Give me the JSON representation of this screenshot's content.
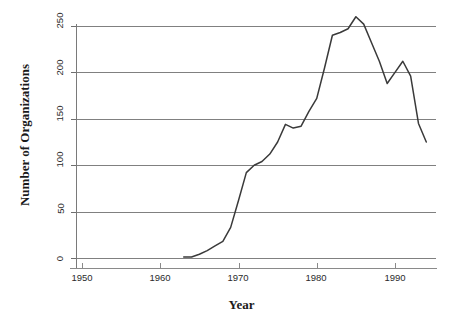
{
  "chart_data": {
    "type": "line",
    "title": "",
    "xlabel": "Year",
    "ylabel": "Number of Organizations",
    "xlim": [
      1947,
      1996
    ],
    "ylim": [
      0,
      265
    ],
    "grid": true,
    "legend": "none",
    "x_ticks": [
      1950,
      1960,
      1970,
      1980,
      1990
    ],
    "y_ticks": [
      0,
      50,
      100,
      150,
      200,
      250
    ],
    "x": [
      1963,
      1964,
      1965,
      1966,
      1967,
      1968,
      1969,
      1970,
      1971,
      1972,
      1973,
      1974,
      1975,
      1976,
      1977,
      1978,
      1979,
      1980,
      1981,
      1982,
      1983,
      1984,
      1985,
      1986,
      1987,
      1988,
      1989,
      1990,
      1991,
      1992,
      1993,
      1994
    ],
    "values": [
      1,
      1,
      4,
      8,
      13,
      18,
      33,
      62,
      92,
      100,
      104,
      112,
      125,
      144,
      140,
      142,
      158,
      172,
      205,
      240,
      243,
      247,
      260,
      252,
      232,
      212,
      188,
      200,
      212,
      196,
      145,
      125
    ],
    "series": [
      {
        "name": "Number of Organizations",
        "values": [
          1,
          1,
          4,
          8,
          13,
          18,
          33,
          62,
          92,
          100,
          104,
          112,
          125,
          144,
          140,
          142,
          158,
          172,
          205,
          240,
          243,
          247,
          260,
          252,
          232,
          212,
          188,
          200,
          212,
          196,
          145,
          125
        ]
      }
    ],
    "line_color": "#3a3a3a",
    "grid_color": "#808080",
    "axis_color": "#6e6e6e",
    "background": "#ffffff"
  },
  "axes": {
    "y_title": "Number of Organizations",
    "x_title": "Year",
    "y_tick_labels": [
      "0",
      "50",
      "100",
      "150",
      "200",
      "250"
    ],
    "x_tick_labels": [
      "1950",
      "1960",
      "1970",
      "1980",
      "1990"
    ]
  }
}
